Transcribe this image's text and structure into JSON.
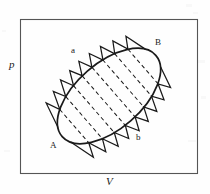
{
  "figure": {
    "type": "thermodynamic-pv-diagram",
    "background_color": "#ffffff",
    "ink_color": "#1a1a1a",
    "frame": {
      "stroke": "#555555",
      "stroke_width": 1,
      "x": 20,
      "y": 19,
      "width": 178,
      "height": 155
    },
    "axes": {
      "y_label": "p",
      "x_label": "V"
    },
    "labels": {
      "point_A": "A",
      "point_B": "B",
      "path_upper": "a",
      "path_lower": "b"
    },
    "cycle": {
      "shape": "ellipse",
      "center_x": 109,
      "center_y": 96,
      "semi_major": 62,
      "semi_minor": 33,
      "rotation_deg": -41,
      "stroke_width": 1.6
    },
    "zigzag": {
      "teeth": 9,
      "stroke_width": 1.2,
      "orientation_deg": -41
    },
    "dashed_lines": {
      "count": 7,
      "dash_pattern": "4 3",
      "stroke_width": 1.0
    }
  }
}
